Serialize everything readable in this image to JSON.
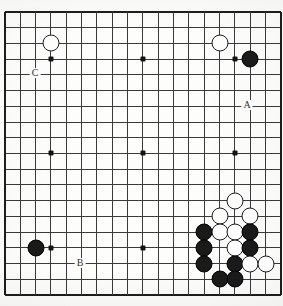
{
  "diagram": {
    "board_size": 19,
    "colors": {
      "board_background": "#fdfdfc",
      "grid_line": "#3a3a3a",
      "border_line": "#1d1d1d",
      "black_stone": "#1a1a1a",
      "white_stone": "#fdfdfd",
      "label_text": "#333333"
    },
    "geometry": {
      "origin_x": 5,
      "origin_y": 12,
      "cell_w": 15.33,
      "cell_h": 15.72,
      "stone_diameter": 17,
      "hoshi_size": 5
    },
    "hoshi_points": [
      {
        "col": 3,
        "row": 3
      },
      {
        "col": 9,
        "row": 3
      },
      {
        "col": 15,
        "row": 3
      },
      {
        "col": 3,
        "row": 9
      },
      {
        "col": 9,
        "row": 9
      },
      {
        "col": 15,
        "row": 9
      },
      {
        "col": 3,
        "row": 15
      },
      {
        "col": 9,
        "row": 15
      },
      {
        "col": 15,
        "row": 15
      }
    ],
    "stones": [
      {
        "color": "white",
        "col": 3,
        "row": 2
      },
      {
        "color": "white",
        "col": 14,
        "row": 2
      },
      {
        "color": "black",
        "col": 16,
        "row": 3
      },
      {
        "color": "white",
        "col": 15,
        "row": 12
      },
      {
        "color": "white",
        "col": 14,
        "row": 13
      },
      {
        "color": "white",
        "col": 16,
        "row": 13
      },
      {
        "color": "black",
        "col": 13,
        "row": 14
      },
      {
        "color": "white",
        "col": 14,
        "row": 14
      },
      {
        "color": "white",
        "col": 15,
        "row": 14
      },
      {
        "color": "black",
        "col": 16,
        "row": 14
      },
      {
        "color": "black",
        "col": 2,
        "row": 15
      },
      {
        "color": "black",
        "col": 13,
        "row": 15
      },
      {
        "color": "white",
        "col": 15,
        "row": 15
      },
      {
        "color": "black",
        "col": 16,
        "row": 15
      },
      {
        "color": "black",
        "col": 13,
        "row": 16
      },
      {
        "color": "black",
        "col": 15,
        "row": 16
      },
      {
        "color": "white",
        "col": 16,
        "row": 16
      },
      {
        "color": "white",
        "col": 17,
        "row": 16
      },
      {
        "color": "black",
        "col": 14,
        "row": 17
      },
      {
        "color": "black",
        "col": 15,
        "row": 17
      }
    ],
    "labels": [
      {
        "text": "A",
        "x": 247,
        "y": 105
      },
      {
        "text": "B",
        "x": 80,
        "y": 263
      },
      {
        "text": "C",
        "x": 35,
        "y": 73
      }
    ]
  }
}
